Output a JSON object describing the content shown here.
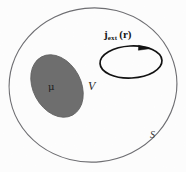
{
  "figure": {
    "type": "physics-diagram",
    "background_color": "#fdfdfd"
  },
  "labels": {
    "volume": "V",
    "surface": "S",
    "moment": "μ",
    "current_symbol": "j",
    "current_subscript": "ext",
    "current_argument": "(r)",
    "current_full": "j_ext (r)"
  },
  "shapes": {
    "outer_boundary": {
      "name": "surface-S-ellipse",
      "cx": 93,
      "cy": 85,
      "rx": 84,
      "ry": 77,
      "rotation": -6,
      "stroke": "#6e6e72",
      "stroke_width": 1.1,
      "fill": "none"
    },
    "magnetized_region": {
      "name": "mu-region-ellipse",
      "cx": 57,
      "cy": 86,
      "rx": 24,
      "ry": 33,
      "rotation": -28,
      "fill": "#6e6e6e",
      "stroke": "#5e5e5e",
      "stroke_width": 0.8
    },
    "current_loop": {
      "name": "current-loop-ellipse",
      "cx": 131,
      "cy": 62,
      "rx": 31,
      "ry": 16,
      "rotation": -3,
      "stroke": "#121212",
      "stroke_width": 1.6,
      "fill": "none",
      "arrow_direction": "clockwise",
      "arrow_position": "top-right"
    }
  },
  "colors": {
    "boundary_gray": "#6e6e72",
    "region_fill": "#6e6e6e",
    "loop_black": "#121212",
    "text": "#1a1a1a"
  }
}
